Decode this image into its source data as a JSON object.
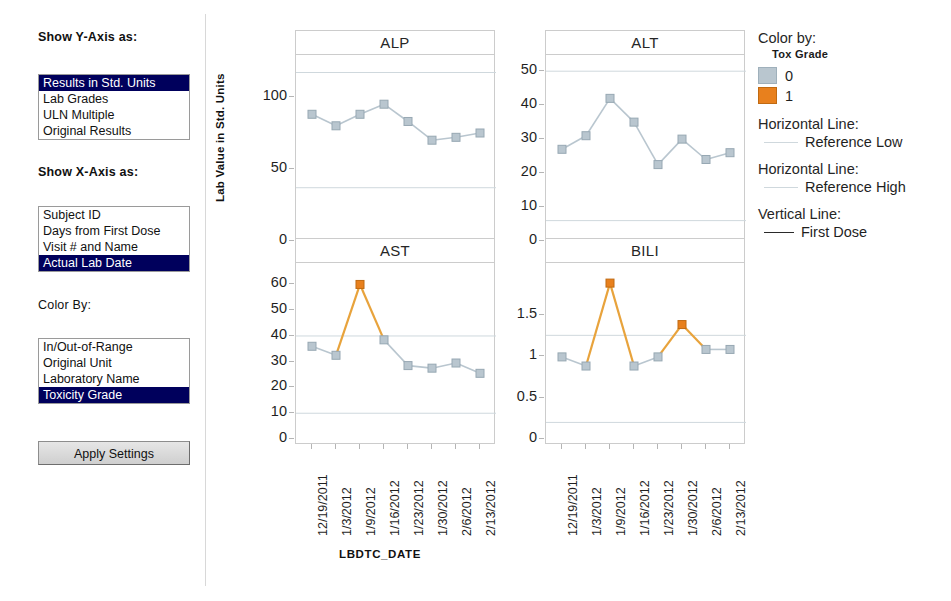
{
  "controls": {
    "y_axis": {
      "label": "Show Y-Axis as:",
      "options": [
        "Results in Std. Units",
        "Lab Grades",
        "ULN Multiple",
        "Original Results"
      ],
      "selected": "Results in Std. Units"
    },
    "x_axis": {
      "label": "Show X-Axis as:",
      "options": [
        "Subject ID",
        "Days from First Dose",
        "Visit # and Name",
        "Actual Lab Date"
      ],
      "selected": "Actual Lab Date"
    },
    "color_by": {
      "label": "Color By:",
      "options": [
        "In/Out-of-Range",
        "Original Unit",
        "Laboratory Name",
        "Toxicity Grade"
      ],
      "selected": "Toxicity Grade"
    },
    "apply_button": "Apply Settings"
  },
  "legend": {
    "color_by_heading": "Color by:",
    "color_by_variable": "Tox Grade",
    "grades": [
      {
        "value": "0",
        "color": "#b9c6cf"
      },
      {
        "value": "1",
        "color": "#e8801d"
      }
    ],
    "lines": [
      {
        "heading": "Horizontal Line:",
        "label": "Reference Low",
        "style": "reference"
      },
      {
        "heading": "Horizontal Line:",
        "label": "Reference High",
        "style": "reference"
      },
      {
        "heading": "Vertical Line:",
        "label": "First Dose",
        "style": "solid"
      }
    ]
  },
  "chart_data": {
    "type": "line",
    "title": "",
    "xlabel": "LBDTC_DATE",
    "ylabel": "Lab Value in Std. Units",
    "grid": true,
    "legend_position": "right",
    "x": [
      "12/19/2011",
      "1/3/2012",
      "1/9/2012",
      "1/16/2012",
      "1/23/2012",
      "1/30/2012",
      "2/6/2012",
      "2/13/2012"
    ],
    "panels": [
      {
        "name": "ALP",
        "ylim": [
          0,
          125
        ],
        "yticks": [
          0,
          50,
          100
        ],
        "ytick_labels": [
          "0",
          "50",
          "100"
        ],
        "reference_low": 37,
        "reference_high": 117,
        "values": [
          88,
          80,
          88,
          95,
          83,
          70,
          72,
          75
        ],
        "tox_grades": [
          0,
          0,
          0,
          0,
          0,
          0,
          0,
          0
        ]
      },
      {
        "name": "ALT",
        "ylim": [
          0,
          53
        ],
        "yticks": [
          0,
          10,
          20,
          30,
          40,
          50
        ],
        "ytick_labels": [
          "0",
          "10",
          "20",
          "30",
          "40",
          "50"
        ],
        "reference_low": 6,
        "reference_high": 50,
        "values": [
          27,
          31,
          42,
          35,
          22.5,
          30,
          24,
          26
        ],
        "tox_grades": [
          0,
          0,
          0,
          0,
          0,
          0,
          0,
          0
        ]
      },
      {
        "name": "AST",
        "ylim": [
          0,
          66
        ],
        "yticks": [
          0,
          10,
          20,
          30,
          40,
          50,
          60
        ],
        "ytick_labels": [
          "0",
          "10",
          "20",
          "30",
          "40",
          "50",
          "60"
        ],
        "reference_low": 10,
        "reference_high": 40,
        "values": [
          36,
          32.5,
          60,
          38.5,
          28.5,
          27.5,
          29.5,
          25.5
        ],
        "tox_grades": [
          0,
          0,
          1,
          0,
          0,
          0,
          0,
          0
        ]
      },
      {
        "name": "BILI",
        "ylim": [
          0,
          2.05
        ],
        "yticks": [
          0,
          0.5,
          1,
          1.5
        ],
        "ytick_labels": [
          "0",
          "0.5",
          "1",
          "1.5"
        ],
        "reference_low": 0.2,
        "reference_high": 1.25,
        "values": [
          0.99,
          0.88,
          1.88,
          0.88,
          0.99,
          1.38,
          1.08,
          1.08
        ],
        "tox_grades": [
          0,
          0,
          1,
          0,
          0,
          1,
          0,
          0
        ]
      }
    ],
    "colors": {
      "grade0_marker": "#b9c6cf",
      "grade0_line": "#b9c6cf",
      "grade1_marker": "#e8801d",
      "grade1_line": "#e8a33c",
      "reference_line": "#cfd8dd",
      "panel_border": "#cccccc"
    }
  }
}
